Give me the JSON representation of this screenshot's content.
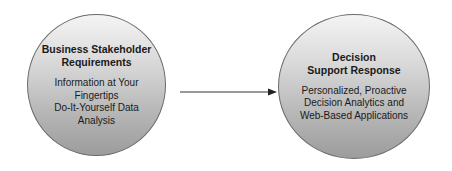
{
  "diagram": {
    "nodes": [
      {
        "id": "business-stakeholder-requirements",
        "title_lines": [
          "Business Stakeholder",
          "Requirements"
        ],
        "body_lines": [
          "Information at Your",
          "Fingertips",
          "Do-It-Yourself Data",
          "Analysis"
        ]
      },
      {
        "id": "decision-support-response",
        "title_lines": [
          "Decision",
          "Support Response"
        ],
        "body_lines": [
          "Personalized, Proactive",
          "Decision Analytics and",
          "Web-Based Applications"
        ]
      }
    ],
    "edges": [
      {
        "from": "business-stakeholder-requirements",
        "to": "decision-support-response",
        "style": "arrow"
      }
    ],
    "colors": {
      "circle_top": "#f4f4f4",
      "circle_bottom": "#9c9c9c",
      "outline": "#6a6a6a",
      "arrow": "#333333",
      "text": "#1a1a1a"
    }
  }
}
